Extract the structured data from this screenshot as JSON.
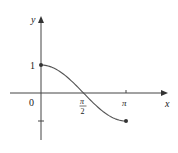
{
  "figure": {
    "axes": {
      "x_label": "x",
      "y_label": "y",
      "origin_label": "0",
      "x_ticks": [
        {
          "label_num": "π",
          "label_den": "2",
          "value": 1.5708
        },
        {
          "label": "π",
          "value": 3.1416
        }
      ],
      "y_ticks": [
        {
          "label": "1",
          "value": 1
        },
        {
          "label": "",
          "value": -1
        }
      ]
    },
    "curve": {
      "function": "cos(x)",
      "domain": [
        0,
        3.1416
      ],
      "start_point": [
        0,
        1
      ],
      "end_point": [
        3.1416,
        -1
      ],
      "color": "#555555"
    },
    "colors": {
      "axis": "#444444",
      "curve": "#555555",
      "point": "#333333"
    }
  }
}
